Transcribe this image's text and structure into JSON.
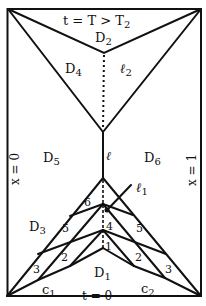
{
  "diagram": {
    "top_label": "t = T > T",
    "top_label_sub": "2",
    "bottom_label": "t = 0",
    "left_label": "x = 0",
    "right_label": "x = 1",
    "regions": [
      {
        "name": "D",
        "sub": "1"
      },
      {
        "name": "D",
        "sub": "2"
      },
      {
        "name": "D",
        "sub": "3"
      },
      {
        "name": "D",
        "sub": "4"
      },
      {
        "name": "D",
        "sub": "5"
      },
      {
        "name": "D",
        "sub": "6"
      }
    ],
    "curves": [
      {
        "name": "ℓ",
        "sub": ""
      },
      {
        "name": "ℓ",
        "sub": "1"
      },
      {
        "name": "ℓ",
        "sub": "2"
      },
      {
        "name": "c",
        "sub": "1"
      },
      {
        "name": "c",
        "sub": "2"
      }
    ],
    "segment_numbers": [
      "6",
      "5",
      "3",
      "2",
      "4",
      "1",
      "5",
      "2",
      "3"
    ]
  }
}
